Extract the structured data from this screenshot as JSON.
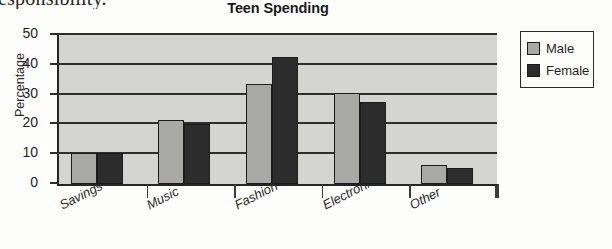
{
  "page": {
    "cut_off_text_above": "esponsibility."
  },
  "legend": {
    "position": "right",
    "entries": [
      {
        "label": "Male",
        "color": "#a8a8a6"
      },
      {
        "label": "Female",
        "color": "#2c2c2c"
      }
    ]
  },
  "chart_data": {
    "type": "bar",
    "title": "Teen Spending",
    "xlabel": "",
    "ylabel": "Percentage",
    "ylim": [
      0,
      50
    ],
    "yticks": [
      0,
      10,
      20,
      30,
      40,
      50
    ],
    "grid": true,
    "categories": [
      "Savings",
      "Music",
      "Fashion",
      "Electronics",
      "Other"
    ],
    "series": [
      {
        "name": "Male",
        "color": "#a8a8a6",
        "values": [
          10.5,
          21.5,
          33.5,
          30.5,
          6.5
        ]
      },
      {
        "name": "Female",
        "color": "#2c2c2c",
        "values": [
          10.5,
          20,
          42.5,
          27.5,
          5.5
        ]
      }
    ]
  }
}
